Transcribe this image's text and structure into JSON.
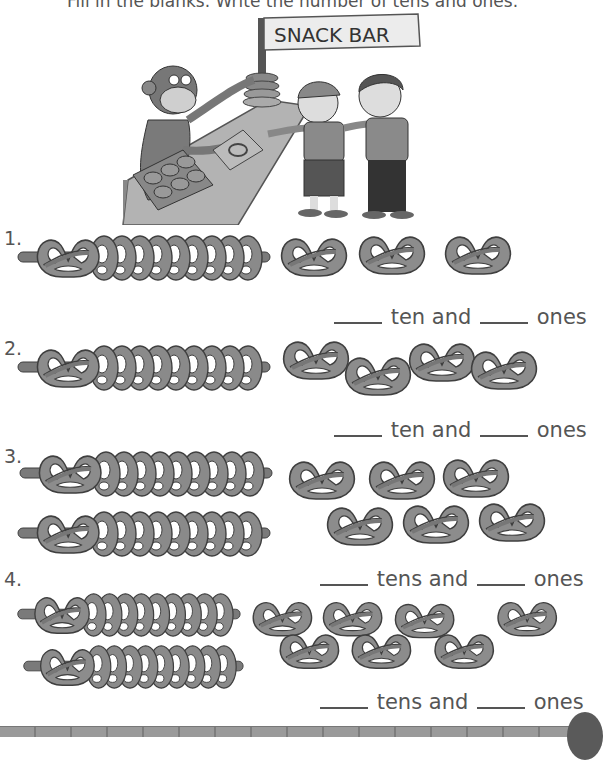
{
  "worksheet": {
    "instruction": "Fill in the blanks. Write the number of tens and ones.",
    "illustration": {
      "sign_text": "SNACK BAR",
      "description": "monkey vendor stacking pretzels on a pole at a snack bar counter; two boys reaching for pretzels"
    },
    "colors": {
      "pretzel_fill": "#8c8c8c",
      "pretzel_outline": "#3f3f3f",
      "stick": "#7a7a7a",
      "text": "#555555"
    },
    "problems": [
      {
        "number": "1.",
        "sticks_of_ten": 1,
        "loose_ones": 3,
        "answer_text_tens": "ten and",
        "answer_text_ones": "ones"
      },
      {
        "number": "2.",
        "sticks_of_ten": 1,
        "loose_ones": 4,
        "answer_text_tens": "ten and",
        "answer_text_ones": "ones"
      },
      {
        "number": "3.",
        "sticks_of_ten": 2,
        "loose_ones": 6,
        "answer_text_tens": "tens and",
        "answer_text_ones": "ones"
      },
      {
        "number": "4.",
        "sticks_of_ten": 2,
        "loose_ones": 7,
        "answer_text_tens": "tens and",
        "answer_text_ones": "ones"
      }
    ]
  }
}
